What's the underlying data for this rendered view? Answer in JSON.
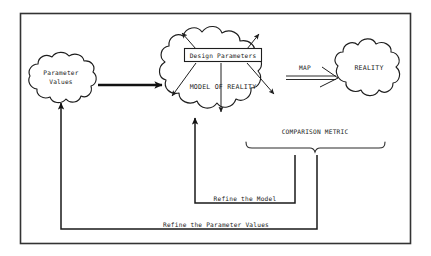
{
  "diagram": {
    "frame": {
      "name": "outer-border"
    },
    "nodes": {
      "parameter_values": {
        "label_line1": "Parameter",
        "label_line2": "Values",
        "shape": "cloud"
      },
      "model_of_reality": {
        "label": "MODEL OF REALITY",
        "shape": "cloud"
      },
      "design_parameters": {
        "label": "Design Parameters",
        "shape": "rectangle"
      },
      "reality": {
        "label": "REALITY",
        "shape": "cloud"
      }
    },
    "edges": {
      "map_arrow": {
        "label": "MAP"
      },
      "comparison_metric": {
        "label": "COMPARISON METRIC"
      },
      "refine_model": {
        "label": "Refine the Model"
      },
      "refine_parameter_values": {
        "label": "Refine the Parameter Values"
      },
      "params_to_model": {
        "label": ""
      }
    },
    "colors": {
      "ink": "#1e1e1e",
      "frame": "#333333",
      "background": "#ffffff"
    }
  }
}
